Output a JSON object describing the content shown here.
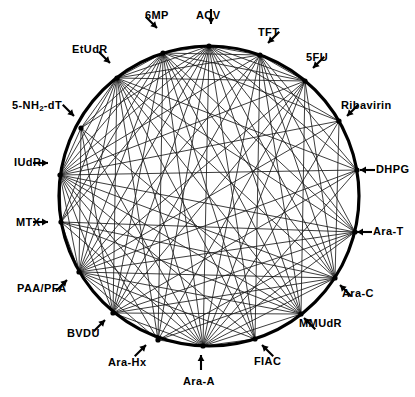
{
  "figure": {
    "type": "circular-chord-diagram",
    "title": "",
    "node_count": 18,
    "geometry": {
      "center_x": 209,
      "center_y": 196,
      "radius": 150
    },
    "colors": {
      "stroke": "#000000",
      "chord": "#1a1a1a",
      "background": "#ffffff"
    }
  },
  "nodes": [
    {
      "id": "ACV",
      "label": "ACV",
      "angle_deg": 90,
      "x": 209,
      "y": 46,
      "label_x": 196,
      "label_y": 10,
      "arrow": "down",
      "arrow_x": 211,
      "arrow_y": 24
    },
    {
      "id": "TFT",
      "label": "TFT",
      "angle_deg": 70,
      "x": 260,
      "y": 55,
      "label_x": 258,
      "label_y": 27,
      "arrow": "down-left",
      "arrow_x": 268,
      "arrow_y": 43
    },
    {
      "id": "5FU",
      "label": "5FU",
      "angle_deg": 50,
      "x": 305,
      "y": 81,
      "label_x": 306,
      "label_y": 52,
      "arrow": "down-left",
      "arrow_x": 313,
      "arrow_y": 68
    },
    {
      "id": "Ribavirin",
      "label": "Ribavirin",
      "angle_deg": 30,
      "x": 339,
      "y": 121,
      "label_x": 341,
      "label_y": 100,
      "arrow": "down-left",
      "arrow_x": 347,
      "arrow_y": 116
    },
    {
      "id": "DHPG",
      "label": "DHPG",
      "angle_deg": 10,
      "x": 357,
      "y": 170,
      "label_x": 376,
      "label_y": 164,
      "arrow": "left",
      "arrow_x": 360,
      "arrow_y": 170
    },
    {
      "id": "Ara-T",
      "label": "Ara-T",
      "angle_deg": -14,
      "x": 355,
      "y": 232,
      "label_x": 373,
      "label_y": 226,
      "arrow": "left",
      "arrow_x": 357,
      "arrow_y": 232
    },
    {
      "id": "Ara-C",
      "label": "Ara-C",
      "angle_deg": -33,
      "x": 335,
      "y": 278,
      "label_x": 342,
      "label_y": 288,
      "arrow": "up-left",
      "arrow_x": 340,
      "arrow_y": 285
    },
    {
      "id": "MMUdR",
      "label": "MMUdR",
      "angle_deg": -52,
      "x": 301,
      "y": 314,
      "label_x": 299,
      "label_y": 318,
      "arrow": "up-left",
      "arrow_x": 304,
      "arrow_y": 318
    },
    {
      "id": "FIAC",
      "label": "FIAC",
      "angle_deg": -72,
      "x": 255,
      "y": 339,
      "label_x": 254,
      "label_y": 356,
      "arrow": "up-left",
      "arrow_x": 262,
      "arrow_y": 345
    },
    {
      "id": "Ara-A",
      "label": "Ara-A",
      "angle_deg": -90,
      "x": 203,
      "y": 346,
      "label_x": 183,
      "label_y": 376,
      "arrow": "up",
      "arrow_x": 201,
      "arrow_y": 355
    },
    {
      "id": "Ara-Hx",
      "label": "Ara-Hx",
      "angle_deg": -110,
      "x": 158,
      "y": 340,
      "label_x": 108,
      "label_y": 357,
      "arrow": "up-right",
      "arrow_x": 146,
      "arrow_y": 345
    },
    {
      "id": "BVDU",
      "label": "BVDU",
      "angle_deg": -130,
      "x": 113,
      "y": 313,
      "label_x": 67,
      "label_y": 328,
      "arrow": "up-right",
      "arrow_x": 105,
      "arrow_y": 320
    },
    {
      "id": "PAA/PFA",
      "label": "PAA/PFA",
      "angle_deg": -150,
      "x": 79,
      "y": 272,
      "label_x": 17,
      "label_y": 283,
      "arrow": "up-right",
      "arrow_x": 67,
      "arrow_y": 280
    },
    {
      "id": "MTX",
      "label": "MTX",
      "angle_deg": -170,
      "x": 61,
      "y": 222,
      "label_x": 16,
      "label_y": 217,
      "arrow": "right",
      "arrow_x": 48,
      "arrow_y": 222
    },
    {
      "id": "IUdR",
      "label": "IUdR",
      "angle_deg": 172,
      "x": 60,
      "y": 175,
      "label_x": 14,
      "label_y": 157,
      "arrow": "right",
      "arrow_x": 48,
      "arrow_y": 163
    },
    {
      "id": "5-NH2-dT",
      "label": "5-NH2-dT",
      "angle_deg": 152,
      "x": 81,
      "y": 128,
      "label_x": 12,
      "label_y": 100,
      "arrow": "down-right",
      "arrow_x": 74,
      "arrow_y": 116
    },
    {
      "id": "EtUdR",
      "label": "EtUdR",
      "angle_deg": 132,
      "x": 117,
      "y": 78,
      "label_x": 72,
      "label_y": 44,
      "arrow": "down-right",
      "arrow_x": 110,
      "arrow_y": 63
    },
    {
      "id": "6MP",
      "label": "6MP",
      "angle_deg": 110,
      "x": 163,
      "y": 53,
      "label_x": 145,
      "label_y": 10,
      "arrow": "down-right",
      "arrow_x": 157,
      "arrow_y": 28
    }
  ],
  "edges": [
    [
      "ACV",
      "5FU"
    ],
    [
      "ACV",
      "Ribavirin"
    ],
    [
      "ACV",
      "DHPG"
    ],
    [
      "ACV",
      "Ara-T"
    ],
    [
      "ACV",
      "Ara-C"
    ],
    [
      "ACV",
      "MMUdR"
    ],
    [
      "ACV",
      "FIAC"
    ],
    [
      "ACV",
      "Ara-A"
    ],
    [
      "ACV",
      "Ara-Hx"
    ],
    [
      "ACV",
      "BVDU"
    ],
    [
      "ACV",
      "PAA/PFA"
    ],
    [
      "ACV",
      "MTX"
    ],
    [
      "ACV",
      "IUdR"
    ],
    [
      "ACV",
      "5-NH2-dT"
    ],
    [
      "ACV",
      "EtUdR"
    ],
    [
      "ACV",
      "6MP"
    ],
    [
      "ACV",
      "TFT"
    ],
    [
      "TFT",
      "5FU"
    ],
    [
      "TFT",
      "DHPG"
    ],
    [
      "TFT",
      "Ara-T"
    ],
    [
      "TFT",
      "Ara-C"
    ],
    [
      "TFT",
      "MMUdR"
    ],
    [
      "TFT",
      "FIAC"
    ],
    [
      "TFT",
      "Ara-A"
    ],
    [
      "TFT",
      "BVDU"
    ],
    [
      "TFT",
      "PAA/PFA"
    ],
    [
      "TFT",
      "IUdR"
    ],
    [
      "TFT",
      "EtUdR"
    ],
    [
      "TFT",
      "6MP"
    ],
    [
      "5FU",
      "Ara-C"
    ],
    [
      "5FU",
      "MMUdR"
    ],
    [
      "5FU",
      "Ara-A"
    ],
    [
      "5FU",
      "BVDU"
    ],
    [
      "5FU",
      "PAA/PFA"
    ],
    [
      "5FU",
      "IUdR"
    ],
    [
      "5FU",
      "EtUdR"
    ],
    [
      "5FU",
      "6MP"
    ],
    [
      "5FU",
      "Ara-Hx"
    ],
    [
      "Ribavirin",
      "Ara-C"
    ],
    [
      "Ribavirin",
      "Ara-A"
    ],
    [
      "Ribavirin",
      "IUdR"
    ],
    [
      "Ribavirin",
      "PAA/PFA"
    ],
    [
      "Ribavirin",
      "6MP"
    ],
    [
      "DHPG",
      "Ara-A"
    ],
    [
      "DHPG",
      "IUdR"
    ],
    [
      "DHPG",
      "PAA/PFA"
    ],
    [
      "DHPG",
      "BVDU"
    ],
    [
      "DHPG",
      "EtUdR"
    ],
    [
      "Ara-T",
      "Ara-A"
    ],
    [
      "Ara-T",
      "IUdR"
    ],
    [
      "Ara-T",
      "PAA/PFA"
    ],
    [
      "Ara-T",
      "BVDU"
    ],
    [
      "Ara-T",
      "Ara-Hx"
    ],
    [
      "Ara-T",
      "EtUdR"
    ],
    [
      "Ara-T",
      "6MP"
    ],
    [
      "Ara-T",
      "MTX"
    ],
    [
      "Ara-C",
      "Ara-A"
    ],
    [
      "Ara-C",
      "IUdR"
    ],
    [
      "Ara-C",
      "PAA/PFA"
    ],
    [
      "Ara-C",
      "BVDU"
    ],
    [
      "Ara-C",
      "MTX"
    ],
    [
      "Ara-C",
      "EtUdR"
    ],
    [
      "Ara-C",
      "6MP"
    ],
    [
      "Ara-C",
      "Ara-Hx"
    ],
    [
      "MMUdR",
      "Ara-A"
    ],
    [
      "MMUdR",
      "IUdR"
    ],
    [
      "MMUdR",
      "PAA/PFA"
    ],
    [
      "MMUdR",
      "MTX"
    ],
    [
      "MMUdR",
      "EtUdR"
    ],
    [
      "MMUdR",
      "6MP"
    ],
    [
      "MMUdR",
      "5-NH2-dT"
    ],
    [
      "MMUdR",
      "BVDU"
    ],
    [
      "FIAC",
      "Ara-A"
    ],
    [
      "FIAC",
      "IUdR"
    ],
    [
      "FIAC",
      "PAA/PFA"
    ],
    [
      "FIAC",
      "EtUdR"
    ],
    [
      "FIAC",
      "6MP"
    ],
    [
      "Ara-A",
      "Ara-Hx"
    ],
    [
      "Ara-A",
      "BVDU"
    ],
    [
      "Ara-A",
      "PAA/PFA"
    ],
    [
      "Ara-A",
      "MTX"
    ],
    [
      "Ara-A",
      "IUdR"
    ],
    [
      "Ara-A",
      "5-NH2-dT"
    ],
    [
      "Ara-A",
      "EtUdR"
    ],
    [
      "Ara-A",
      "6MP"
    ],
    [
      "Ara-Hx",
      "IUdR"
    ],
    [
      "Ara-Hx",
      "EtUdR"
    ],
    [
      "Ara-Hx",
      "6MP"
    ],
    [
      "Ara-Hx",
      "PAA/PFA"
    ],
    [
      "BVDU",
      "IUdR"
    ],
    [
      "BVDU",
      "EtUdR"
    ],
    [
      "BVDU",
      "6MP"
    ],
    [
      "BVDU",
      "5-NH2-dT"
    ],
    [
      "PAA/PFA",
      "IUdR"
    ],
    [
      "PAA/PFA",
      "EtUdR"
    ],
    [
      "PAA/PFA",
      "6MP"
    ],
    [
      "PAA/PFA",
      "5-NH2-dT"
    ],
    [
      "PAA/PFA",
      "MTX"
    ],
    [
      "MTX",
      "EtUdR"
    ],
    [
      "MTX",
      "6MP"
    ],
    [
      "MTX",
      "IUdR"
    ],
    [
      "IUdR",
      "5-NH2-dT"
    ],
    [
      "IUdR",
      "EtUdR"
    ],
    [
      "IUdR",
      "6MP"
    ],
    [
      "5-NH2-dT",
      "EtUdR"
    ],
    [
      "5-NH2-dT",
      "6MP"
    ],
    [
      "EtUdR",
      "6MP"
    ]
  ]
}
